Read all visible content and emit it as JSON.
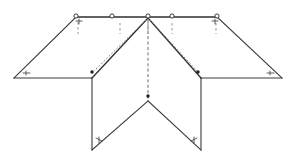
{
  "figure": {
    "background_color": "#ffffff",
    "line_color": "#3a3a3a",
    "dashed_line_color": "#6a6a6a",
    "node_fill_color": "#ffffff",
    "dot_color": "#1f1f1f",
    "canvas": {
      "width": 299,
      "height": 166
    }
  },
  "geometry": {
    "apex": {
      "x": 148,
      "y": 18
    },
    "top_ridge": {
      "x1": 76,
      "y1": 17,
      "x2": 217,
      "y2": 17
    },
    "left_wing": {
      "outer_tip": {
        "x": 14,
        "y": 78
      },
      "inner_corner": {
        "x": 92,
        "y": 78
      }
    },
    "right_wing": {
      "outer_tip": {
        "x": 282,
        "y": 78
      },
      "inner_corner": {
        "x": 201,
        "y": 78
      }
    },
    "inner_left_fold": {
      "from_x": 148,
      "from_y": 18,
      "to_x": 92,
      "to_y": 78
    },
    "inner_right_fold": {
      "from_x": 148,
      "from_y": 18,
      "to_x": 201,
      "to_y": 78
    },
    "center_crease": {
      "x1": 148,
      "y1": 18,
      "x2": 148,
      "y2": 101
    },
    "v_vertex": {
      "x": 148,
      "y": 101
    },
    "bottom_left_vertex": {
      "x": 92,
      "y": 150
    },
    "bottom_right_vertex": {
      "x": 201,
      "y": 150
    },
    "left_panel_vertical": {
      "x": 92,
      "y1": 78,
      "y2": 150
    },
    "right_panel_vertical": {
      "x": 201,
      "y1": 78,
      "y2": 150
    }
  },
  "nodes": {
    "label": "ridge nodes",
    "count": 5,
    "points": [
      {
        "name": "node-1",
        "x": 76,
        "y": 17
      },
      {
        "name": "node-2",
        "x": 112,
        "y": 17
      },
      {
        "name": "node-3",
        "x": 148,
        "y": 17
      },
      {
        "name": "node-4",
        "x": 172,
        "y": 17
      },
      {
        "name": "node-5",
        "x": 217,
        "y": 17
      }
    ],
    "radius": 2.1
  },
  "ticks": {
    "label": "dashed drop ticks below ridge",
    "count": 5,
    "points": [
      {
        "name": "tick-1",
        "x": 78,
        "y1": 22,
        "y2": 34
      },
      {
        "name": "tick-2",
        "x": 120,
        "y1": 23,
        "y2": 34
      },
      {
        "name": "tick-3",
        "x": 148,
        "y1": 23,
        "y2": 34
      },
      {
        "name": "tick-4",
        "x": 172,
        "y1": 23,
        "y2": 34
      },
      {
        "name": "tick-5",
        "x": 216,
        "y1": 23,
        "y2": 34
      }
    ]
  },
  "dots": {
    "label": "crease endpoint dots",
    "points": [
      {
        "name": "dot-left-inner",
        "x": 92,
        "y": 72
      },
      {
        "name": "dot-right-inner",
        "x": 198,
        "y": 72
      },
      {
        "name": "dot-center-vertex",
        "x": 148,
        "y": 96
      }
    ],
    "radius": 1.7
  },
  "angle_marks": {
    "label": "small angle annotation marks",
    "items": [
      {
        "name": "mark-left-tip",
        "x": 26,
        "y": 73
      },
      {
        "name": "mark-right-tip",
        "x": 270,
        "y": 73
      },
      {
        "name": "mark-top-left",
        "x": 79,
        "y": 22
      },
      {
        "name": "mark-top-right",
        "x": 215,
        "y": 22
      },
      {
        "name": "mark-bottom-left",
        "x": 99,
        "y": 140
      },
      {
        "name": "mark-bottom-right",
        "x": 194,
        "y": 140
      }
    ]
  },
  "dotted_guides": {
    "label": "dotted construction lines parallel to inner folds",
    "left": {
      "x1": 146,
      "y1": 20,
      "x2": 94,
      "y2": 71
    },
    "right": {
      "x1": 150,
      "y1": 20,
      "x2": 197,
      "y2": 71
    }
  }
}
